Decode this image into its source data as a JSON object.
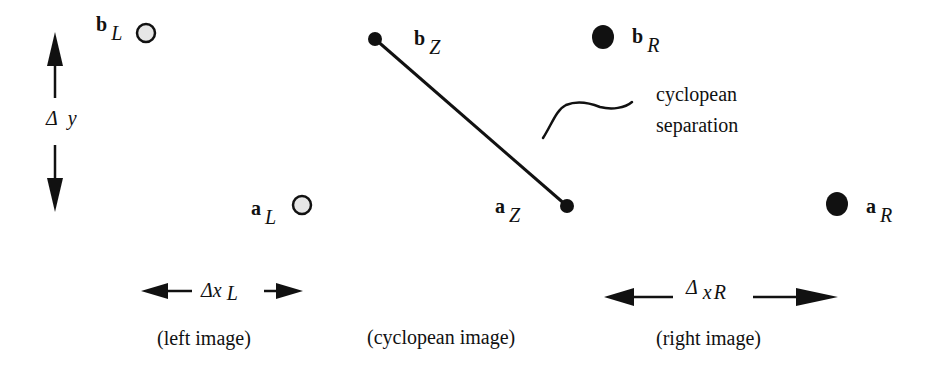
{
  "diagram": {
    "points": {
      "bL": {
        "base": "b",
        "sub": "L",
        "fill": "#e6e6e6"
      },
      "aL": {
        "base": "a",
        "sub": "L",
        "fill": "#e6e6e6"
      },
      "bZ": {
        "base": "b",
        "sub": "Z",
        "fill": "#111111"
      },
      "aZ": {
        "base": "a",
        "sub": "Z",
        "fill": "#111111"
      },
      "bR": {
        "base": "b",
        "sub": "R",
        "fill": "#111111"
      },
      "aR": {
        "base": "a",
        "sub": "R",
        "fill": "#111111"
      }
    },
    "delta_y": {
      "symbol": "Δ",
      "var": "y"
    },
    "delta_xL": {
      "symbol": "Δ",
      "var": "x",
      "sub": "L"
    },
    "delta_xR": {
      "symbol": "Δ",
      "var": "x",
      "sub": "R"
    },
    "annotation": {
      "line1": "cyclopean",
      "line2": "separation"
    },
    "captions": {
      "left": "(left image)",
      "center": "(cyclopean image)",
      "right": "(right image)"
    }
  }
}
